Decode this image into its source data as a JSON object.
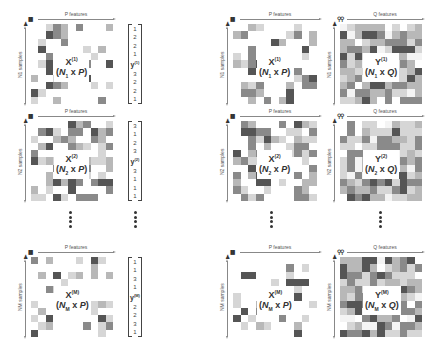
{
  "labels": {
    "p_features": "P features",
    "q_features": "Q features"
  },
  "icons": {
    "features_icon": "bars-icon",
    "person_icon": "person-icon",
    "q_icon": "people-icon"
  },
  "colors": {
    "dark": "#555555",
    "mid": "#8a8a8a",
    "light": "#b8b8b8",
    "pale": "#d6d6d6",
    "text": "#333333"
  },
  "left_column": {
    "panels": [
      {
        "samples_label": "N1 samples",
        "x_label": {
          "name": "X",
          "sup": "(1)",
          "n": "N",
          "nsub": "1",
          "dim": "P"
        },
        "y_vector": {
          "name": "y",
          "sup": "(1)",
          "values_top": [
            "1",
            "2",
            "2",
            "1"
          ],
          "values_bottom": [
            "3",
            "2",
            "2",
            "1"
          ]
        }
      },
      {
        "samples_label": "N2 samples",
        "x_label": {
          "name": "X",
          "sup": "(2)",
          "n": "N",
          "nsub": "2",
          "dim": "P"
        },
        "y_vector": {
          "name": "y",
          "sup": "(2)",
          "values_top": [
            "3",
            "1",
            "2",
            "3"
          ],
          "values_bottom": [
            "3",
            "1",
            "1",
            "1"
          ]
        }
      },
      {
        "samples_label": "NM samples",
        "x_label": {
          "name": "X",
          "sup": "(M)",
          "n": "N",
          "nsub": "M",
          "dim": "P"
        },
        "y_vector": {
          "name": "y",
          "sup": "(M)",
          "values_top": [
            "1",
            "1",
            "3",
            "1"
          ],
          "values_bottom": [
            "2",
            "2",
            "3",
            "1"
          ]
        }
      }
    ]
  },
  "right_column": {
    "panels": [
      {
        "samples_label": "N1 samples",
        "x_label": {
          "name": "X",
          "sup": "(1)",
          "n": "N",
          "nsub": "1",
          "dim": "P"
        },
        "y_label": {
          "name": "Y",
          "sup": "(1)",
          "n": "N",
          "nsub": "1",
          "dim": "Q"
        }
      },
      {
        "samples_label": "N2 samples",
        "x_label": {
          "name": "X",
          "sup": "(2)",
          "n": "N",
          "nsub": "2",
          "dim": "P"
        },
        "y_label": {
          "name": "Y",
          "sup": "(2)",
          "n": "N",
          "nsub": "2",
          "dim": "Q"
        }
      },
      {
        "samples_label": "NM samples",
        "x_label": {
          "name": "X",
          "sup": "(M)",
          "n": "N",
          "nsub": "M",
          "dim": "P"
        },
        "y_label": {
          "name": "Y",
          "sup": "(M)",
          "n": "N",
          "nsub": "M",
          "dim": "Q"
        }
      }
    ]
  },
  "ellipsis": "⋮"
}
